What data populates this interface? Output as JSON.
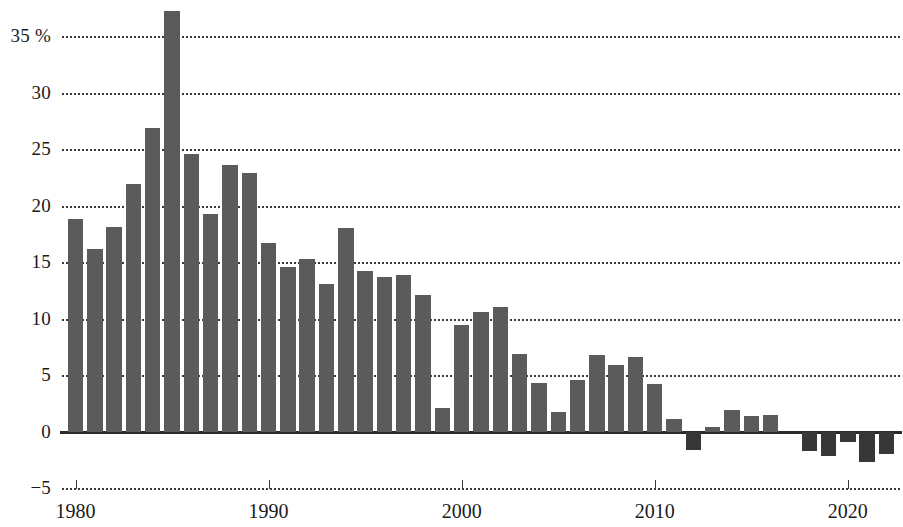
{
  "chart_data": {
    "type": "bar",
    "title": "",
    "subtitle": "",
    "xlabel": "",
    "ylabel": "",
    "unit": "%",
    "ylim": [
      -5,
      37.5
    ],
    "xlim": [
      1979.3,
      2022.7
    ],
    "grid": true,
    "legend": null,
    "y_ticks": [
      35,
      30,
      25,
      20,
      15,
      10,
      5,
      0,
      -5
    ],
    "y_tick_labels": [
      "35 %",
      "30",
      "25",
      "20",
      "15",
      "10",
      "5",
      "0",
      "−5"
    ],
    "x_ticks": [
      1980,
      1990,
      2000,
      2010,
      2020
    ],
    "x_tick_labels": [
      "1980",
      "1990",
      "2000",
      "2010",
      "2020"
    ],
    "colors": {
      "positive_bar": "#5b5b5b",
      "negative_bar": "#373737",
      "gridline": "#2b2b2b",
      "axis": "#2a2a2a",
      "text": "#1a1a1a",
      "background": "#ffffff"
    },
    "categories": [
      "1980",
      "1981",
      "1982",
      "1983",
      "1984",
      "1985",
      "1986",
      "1987",
      "1988",
      "1989",
      "1990",
      "1991",
      "1992",
      "1993",
      "1994",
      "1995",
      "1996",
      "1997",
      "1998",
      "1999",
      "2000",
      "2001",
      "2002",
      "2003",
      "2004",
      "2005",
      "2006",
      "2007",
      "2008",
      "2009",
      "2010",
      "2011",
      "2012",
      "2013",
      "2014",
      "2015",
      "2016",
      "2017",
      "2018",
      "2019",
      "2020",
      "2021",
      "2022"
    ],
    "values": [
      18.8,
      16.2,
      18.1,
      21.9,
      26.9,
      37.2,
      24.6,
      19.3,
      23.6,
      22.9,
      16.7,
      14.6,
      15.3,
      13.1,
      18.0,
      14.2,
      13.7,
      13.9,
      12.1,
      2.1,
      9.4,
      10.6,
      11.0,
      6.9,
      4.3,
      1.7,
      4.6,
      6.8,
      5.9,
      6.6,
      4.2,
      1.1,
      -1.6,
      0.4,
      1.9,
      1.4,
      1.5,
      0.0,
      -1.7,
      -2.2,
      -0.9,
      -2.7,
      -2.0
    ]
  },
  "axis": {
    "percent_symbol": "%"
  }
}
